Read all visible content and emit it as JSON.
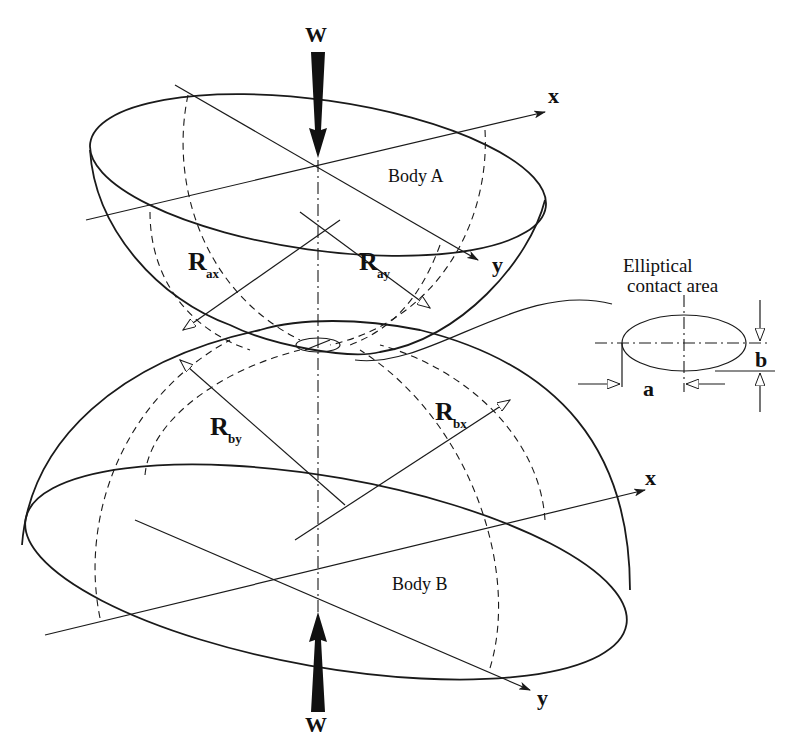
{
  "figure": {
    "load_top": "W",
    "load_bottom": "W",
    "body_a": {
      "label": "Body A",
      "axis_x": "x",
      "axis_y": "y"
    },
    "body_b": {
      "label": "Body B",
      "axis_x": "x",
      "axis_y": "y"
    },
    "radii": [
      {
        "main": "R",
        "sub": "ax"
      },
      {
        "main": "R",
        "sub": "ay"
      },
      {
        "main": "R",
        "sub": "by"
      },
      {
        "main": "R",
        "sub": "bx"
      }
    ],
    "contact": {
      "caption_line1": "Elliptical",
      "caption_line2": "contact area",
      "dim_a": "a",
      "dim_b": "b"
    }
  }
}
